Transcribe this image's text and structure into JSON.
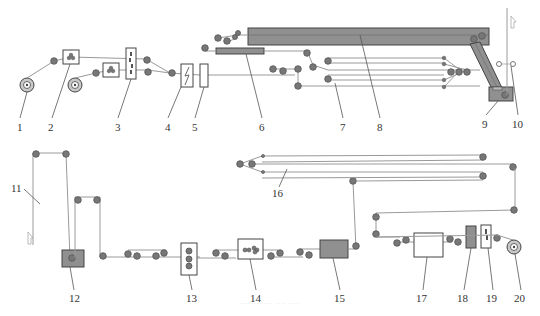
{
  "figure": {
    "type": "process-flow-schematic",
    "caption": "··· ···· ··· ···· ····"
  },
  "labels": [
    {
      "id": "1",
      "text": "1",
      "x": 20,
      "y": 128
    },
    {
      "id": "2",
      "text": "2",
      "x": 52,
      "y": 128
    },
    {
      "id": "3",
      "text": "3",
      "x": 118,
      "y": 128
    },
    {
      "id": "4",
      "text": "4",
      "x": 168,
      "y": 128
    },
    {
      "id": "5",
      "text": "5",
      "x": 195,
      "y": 128
    },
    {
      "id": "6",
      "text": "6",
      "x": 262,
      "y": 128
    },
    {
      "id": "7",
      "text": "7",
      "x": 343,
      "y": 128
    },
    {
      "id": "8",
      "text": "8",
      "x": 380,
      "y": 128
    },
    {
      "id": "9",
      "text": "9",
      "x": 485,
      "y": 126
    },
    {
      "id": "10",
      "text": "10",
      "x": 515,
      "y": 126
    },
    {
      "id": "11",
      "text": "11",
      "x": 12,
      "y": 192
    },
    {
      "id": "12",
      "text": "12",
      "x": 72,
      "y": 300
    },
    {
      "id": "13",
      "text": "13",
      "x": 192,
      "y": 300
    },
    {
      "id": "14",
      "text": "14",
      "x": 256,
      "y": 300
    },
    {
      "id": "15",
      "text": "15",
      "x": 338,
      "y": 300
    },
    {
      "id": "16",
      "text": "16",
      "x": 274,
      "y": 197
    },
    {
      "id": "17",
      "text": "17",
      "x": 423,
      "y": 300
    },
    {
      "id": "18",
      "text": "18",
      "x": 464,
      "y": 300
    },
    {
      "id": "19",
      "text": "19",
      "x": 492,
      "y": 300
    },
    {
      "id": "20",
      "text": "20",
      "x": 519,
      "y": 300
    }
  ],
  "colors": {
    "web_line": "#9a9a9a",
    "roller": "#777777",
    "dark_unit": "#909090",
    "outline": "#444444"
  }
}
